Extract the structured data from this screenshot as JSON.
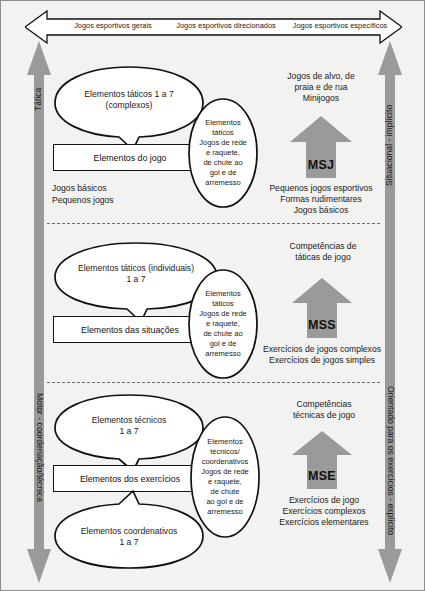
{
  "figure": {
    "bg_color": "#f2f2f0",
    "arrow_color": "#9a9a9a",
    "line_color": "#111111"
  },
  "top_banner": {
    "icon": "double-headed-horizontal-arrow",
    "labels": [
      "Jogos esportivos gerais",
      "Jogos esportivos direcionados",
      "Jogos esportivos específicos"
    ]
  },
  "side_arrows": {
    "left_up": {
      "label": "Tática",
      "direction": "up"
    },
    "left_down": {
      "label": "Motor - coordenação/técnica",
      "direction": "down"
    },
    "right_up": {
      "label": "Situacional - implícito",
      "direction": "up"
    },
    "right_down": {
      "label": "Orientado para os exercícios - explícito",
      "direction": "down"
    }
  },
  "sections": [
    {
      "id": "msj",
      "bubble_top": "Elementos táticos  1 a 7\n(complexos)",
      "rect": "Elementos do jogo",
      "bubble_bottom": null,
      "left_note": "Jogos básicos\nPequenos jogos",
      "tall_ellipse": "Elementos\ntáticos\nJogos de rede\ne raquete,\nde chute ao\ngol e de\narremesso",
      "arrow_top_text": "Jogos de alvo, de\npraia e de rua\nMinijogos",
      "arrow_code": "MSJ",
      "arrow_bottom_text": "Pequenos jogos esportivos\nFormas rudimentares\nJogos básicos"
    },
    {
      "id": "mss",
      "bubble_top": "Elementos táticos (individuais)\n1        a       7",
      "rect": "Elementos das situações",
      "bubble_bottom": null,
      "left_note": null,
      "tall_ellipse": "Elementos\ntáticos\nJogos de rede\ne raquete,\nde chute ao\ngol e de\narremesso",
      "arrow_top_text": "Competências de\ntáticas de jogo",
      "arrow_code": "MSS",
      "arrow_bottom_text": "Exercícios de jogos complexos\nExercícios de jogos simples"
    },
    {
      "id": "mse",
      "bubble_top": "Elementos técnicos\n1        a       7",
      "rect": "Elementos dos exercícios",
      "bubble_bottom": "Elementos coordenativos\n1 a 7",
      "left_note": null,
      "tall_ellipse": "Elementos\ntécnicos/\ncoordenativos\nJogos de rede\ne raquete,\nde chute\nao gol e de\narremesso",
      "arrow_top_text": "Competências\ntécnicas de jogo",
      "arrow_code": "MSE",
      "arrow_bottom_text": "Exercícios de jogo\nExercícios complexos\nExercícios elementares"
    }
  ]
}
